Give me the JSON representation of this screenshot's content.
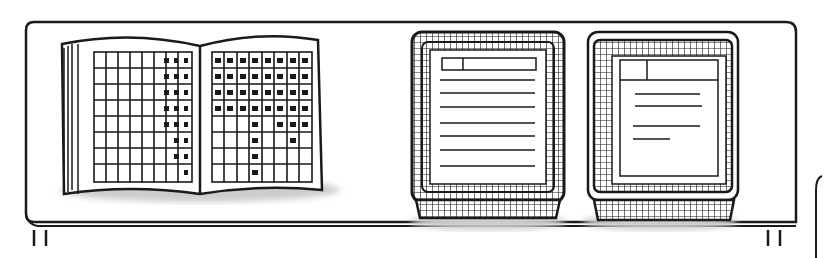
{
  "scene": {
    "description": "Line illustration of a desk holding an open ledger book and two wire inbox trays with documents",
    "colors": {
      "ink": "#1a1a1a",
      "paper": "#ffffff",
      "shadow": "#cfcfcf"
    },
    "objects": [
      {
        "name": "open-ledger-book",
        "grid_columns_per_page": 8,
        "grid_rows": 8
      },
      {
        "name": "inbox-tray-left",
        "document_lines": 7
      },
      {
        "name": "inbox-tray-right",
        "document_lines": 4
      }
    ]
  }
}
